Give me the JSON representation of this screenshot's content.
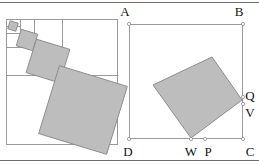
{
  "figure": {
    "background_color": "#ffffff",
    "ink_color": "#141414",
    "outline_color": "#9a9a9a",
    "fill_color": "#bdbdbd",
    "fill_stroke_color": "#8d8d8d",
    "rule_color": "#6e6e6e"
  },
  "rules": {
    "top": {
      "x1": 0,
      "y1": 2.5,
      "x2": 259,
      "y2": 2.5
    },
    "bottom": {
      "x1": 0,
      "y1": 160.5,
      "x2": 259,
      "y2": 160.5
    }
  },
  "left_panel": {
    "name": "nested-squares-construction",
    "outer_square": {
      "x": 6,
      "y": 19,
      "width": 112,
      "height": 126
    },
    "subdivision_lines": [
      {
        "x1": 6,
        "y1": 33,
        "x2": 34,
        "y2": 33
      },
      {
        "x1": 34,
        "y1": 19,
        "x2": 34,
        "y2": 47
      },
      {
        "x1": 6,
        "y1": 47,
        "x2": 62,
        "y2": 47
      },
      {
        "x1": 62,
        "y1": 19,
        "x2": 62,
        "y2": 75
      },
      {
        "x1": 6,
        "y1": 75,
        "x2": 118,
        "y2": 75
      },
      {
        "x1": 20,
        "y1": 19,
        "x2": 20,
        "y2": 33
      },
      {
        "x1": 6,
        "y1": 26,
        "x2": 20,
        "y2": 26
      }
    ],
    "diamonds": [
      {
        "cx": 13,
        "cy": 26,
        "r": 4.2,
        "rotation": 17,
        "label": "diamond-1"
      },
      {
        "cx": 27,
        "cy": 40,
        "r": 8.6,
        "rotation": 17,
        "label": "diamond-2"
      },
      {
        "cx": 48,
        "cy": 61,
        "r": 17.5,
        "rotation": 17,
        "label": "diamond-3"
      },
      {
        "cx": 83,
        "cy": 110,
        "r": 35.5,
        "rotation": 17,
        "label": "diamond-4"
      }
    ]
  },
  "right_panel": {
    "name": "inscribed-square-abcd",
    "outer_square": {
      "x": 129,
      "y": 24,
      "width": 114,
      "height": 115
    },
    "inscribed_square": {
      "vertices": [
        {
          "name": "left",
          "x": 153,
          "y": 85
        },
        {
          "name": "top",
          "x": 212,
          "y": 57
        },
        {
          "name": "right",
          "x": 242,
          "y": 100
        },
        {
          "name": "bottom",
          "x": 191,
          "y": 138
        }
      ]
    },
    "marked_points": [
      {
        "id": "A",
        "x": 129,
        "y": 24
      },
      {
        "id": "B",
        "x": 243,
        "y": 24
      },
      {
        "id": "C",
        "x": 243,
        "y": 139
      },
      {
        "id": "D",
        "x": 129,
        "y": 139
      },
      {
        "id": "Q",
        "x": 243,
        "y": 97
      },
      {
        "id": "V",
        "x": 243,
        "y": 104
      },
      {
        "id": "W",
        "x": 191,
        "y": 139
      },
      {
        "id": "P",
        "x": 205,
        "y": 139
      }
    ],
    "labels": [
      {
        "id": "A",
        "text": "A",
        "x": 125,
        "y": 16,
        "anchor": "middle"
      },
      {
        "id": "B",
        "text": "B",
        "x": 239,
        "y": 16,
        "anchor": "middle"
      },
      {
        "id": "C",
        "text": "C",
        "x": 250,
        "y": 156,
        "anchor": "middle"
      },
      {
        "id": "D",
        "text": "D",
        "x": 128,
        "y": 156,
        "anchor": "middle"
      },
      {
        "id": "Q",
        "text": "Q",
        "x": 250,
        "y": 100,
        "anchor": "middle"
      },
      {
        "id": "V",
        "text": "V",
        "x": 250,
        "y": 117,
        "anchor": "middle"
      },
      {
        "id": "W",
        "text": "W",
        "x": 191,
        "y": 156,
        "anchor": "middle"
      },
      {
        "id": "P",
        "text": "P",
        "x": 208,
        "y": 156,
        "anchor": "middle"
      }
    ]
  }
}
